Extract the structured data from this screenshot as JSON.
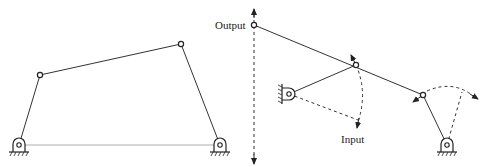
{
  "figure": {
    "left_panel": {
      "title": "",
      "description": "Four-bar linkage with two grounded pivots"
    },
    "right_panel": {
      "labels": {
        "output": "Output",
        "input": "Input"
      }
    }
  },
  "colors": {
    "line": "#333333",
    "background": "#ffffff"
  }
}
